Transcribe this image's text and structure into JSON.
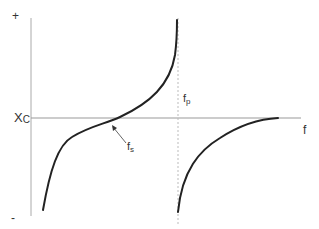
{
  "diagram": {
    "type": "reactance-vs-frequency",
    "y_axis": {
      "label": "X",
      "label_sub": "C",
      "plus_label": "+",
      "minus_label": "-"
    },
    "x_axis": {
      "label": "f"
    },
    "markers": {
      "series_resonance": {
        "label": "f",
        "sub": "s"
      },
      "parallel_resonance": {
        "label": "f",
        "sub": "p"
      }
    },
    "colors": {
      "curve": "#222222",
      "axis": "#999999",
      "dashed": "#bbbbbb",
      "text": "#333333"
    }
  }
}
